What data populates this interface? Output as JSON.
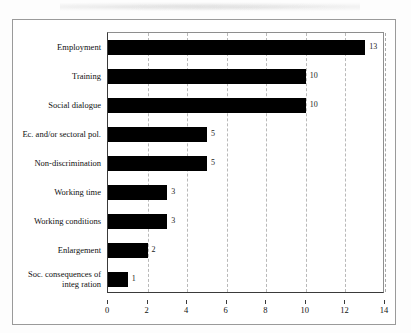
{
  "figure": {
    "frame_color": "#9a9a9a",
    "bar_color": "#000000",
    "grid_color": "#b9b9b9",
    "background": "#ffffff"
  },
  "chart_data": {
    "type": "bar",
    "orientation": "horizontal",
    "title": "",
    "subtitle": "",
    "xlabel": "",
    "ylabel": "",
    "categories": [
      "Employment",
      "Training",
      "Social dialogue",
      "Ec. and/or sectoral pol.",
      "Non-discrimination",
      "Working time",
      "Working conditions",
      "Enlargement",
      "Soc. consequences of\ninteg ration"
    ],
    "values": [
      13,
      10,
      10,
      5,
      5,
      3,
      3,
      2,
      1
    ],
    "data_labels": [
      "13",
      "10",
      "10",
      "5",
      "5",
      "3",
      "3",
      "2",
      "1"
    ],
    "xlim": [
      0,
      14
    ],
    "xticks": [
      0,
      2,
      4,
      6,
      8,
      10,
      12,
      14
    ],
    "xtick_labels": [
      "0",
      "2",
      "4",
      "6",
      "8",
      "10",
      "12",
      "14"
    ],
    "grid": "vertical-dashed",
    "legend": "none"
  }
}
